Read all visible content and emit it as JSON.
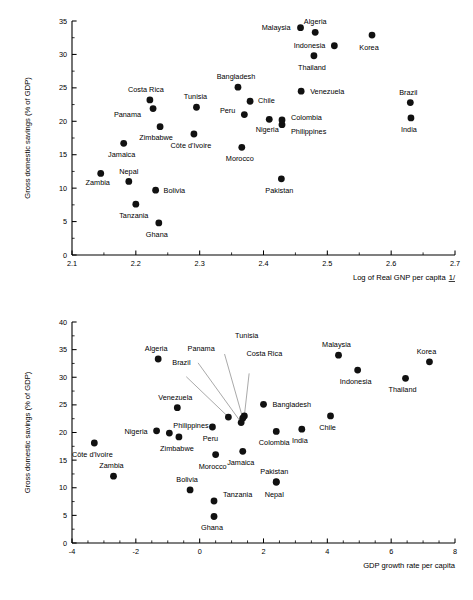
{
  "figure": {
    "background_color": "#ffffff",
    "marker_color": "#111111",
    "axis_color": "#000000",
    "leader_line_color": "#6e6e6e"
  },
  "chart_data": [
    {
      "id": "savings-vs-log-gnp",
      "type": "scatter",
      "title": "",
      "xlabel": "Log of Real GNP per capita 1/",
      "xlabel_text": "Log of Real GNP per capita",
      "xlabel_footnote": "1/",
      "ylabel": "Gross domestic savings (% of GDP)",
      "xlim": [
        2.1,
        2.7
      ],
      "ylim": [
        0,
        35
      ],
      "xticks": [
        2.1,
        2.2,
        2.3,
        2.4,
        2.5,
        2.6,
        2.7
      ],
      "xtick_labels": [
        "2.1",
        "2.2",
        "2.3",
        "2.4",
        "2.5",
        "2.6",
        "2.7"
      ],
      "yticks": [
        0,
        5,
        10,
        15,
        20,
        25,
        30,
        35
      ],
      "ytick_labels": [
        "0",
        "5",
        "10",
        "15",
        "20",
        "25",
        "30",
        "35"
      ],
      "minor_x_step": 0.05,
      "minor_y_step": 2.5,
      "grid": false,
      "legend": "none",
      "points": [
        {
          "name": "Zambia",
          "x": 2.145,
          "y": 12.2,
          "label_dx": -3,
          "label_dy": 12,
          "anchor": "middle"
        },
        {
          "name": "Jamaica",
          "x": 2.181,
          "y": 16.7,
          "label_dx": -2,
          "label_dy": 14,
          "anchor": "middle"
        },
        {
          "name": "Nepal",
          "x": 2.189,
          "y": 11.0,
          "label_dx": 0,
          "label_dy": -7,
          "anchor": "middle"
        },
        {
          "name": "Tanzania",
          "x": 2.2,
          "y": 7.6,
          "label_dx": -2,
          "label_dy": 14,
          "anchor": "middle"
        },
        {
          "name": "Costa Rica",
          "x": 2.222,
          "y": 23.2,
          "label_dx": -4,
          "label_dy": -8,
          "anchor": "middle"
        },
        {
          "name": "Panama",
          "x": 2.227,
          "y": 21.9,
          "label_dx": -12,
          "label_dy": 8,
          "anchor": "end"
        },
        {
          "name": "Bolivia",
          "x": 2.231,
          "y": 9.7,
          "label_dx": 8,
          "label_dy": 3,
          "anchor": "start"
        },
        {
          "name": "Zimbabwe",
          "x": 2.238,
          "y": 19.2,
          "label_dx": -4,
          "label_dy": 13,
          "anchor": "middle"
        },
        {
          "name": "Ghana",
          "x": 2.236,
          "y": 4.8,
          "label_dx": -2,
          "label_dy": 14,
          "anchor": "middle"
        },
        {
          "name": "Tunisia",
          "x": 2.295,
          "y": 22.1,
          "label_dx": -1,
          "label_dy": -8,
          "anchor": "middle"
        },
        {
          "name": "Côte d'Ivoire",
          "x": 2.291,
          "y": 18.1,
          "label_dx": -3,
          "label_dy": 14,
          "anchor": "middle"
        },
        {
          "name": "Bangladesh",
          "x": 2.36,
          "y": 25.1,
          "label_dx": -2,
          "label_dy": -8,
          "anchor": "middle"
        },
        {
          "name": "Morocco",
          "x": 2.366,
          "y": 16.1,
          "label_dx": -2,
          "label_dy": 14,
          "anchor": "middle"
        },
        {
          "name": "Peru",
          "x": 2.37,
          "y": 21.0,
          "label_dx": -9,
          "label_dy": -2,
          "anchor": "end"
        },
        {
          "name": "Chile",
          "x": 2.379,
          "y": 23.0,
          "label_dx": 8,
          "label_dy": 2,
          "anchor": "start"
        },
        {
          "name": "Nigeria",
          "x": 2.409,
          "y": 20.3,
          "label_dx": -2,
          "label_dy": 13,
          "anchor": "middle"
        },
        {
          "name": "Philippines",
          "x": 2.429,
          "y": 19.5,
          "label_dx": 9,
          "label_dy": 9,
          "anchor": "start"
        },
        {
          "name": "Colombia",
          "x": 2.429,
          "y": 20.2,
          "label_dx": 9,
          "label_dy": 0,
          "anchor": "start"
        },
        {
          "name": "Pakistan",
          "x": 2.428,
          "y": 11.4,
          "label_dx": -2,
          "label_dy": 14,
          "anchor": "middle"
        },
        {
          "name": "Malaysia",
          "x": 2.458,
          "y": 34.0,
          "label_dx": -10,
          "label_dy": 2,
          "anchor": "end"
        },
        {
          "name": "Venezuela",
          "x": 2.459,
          "y": 24.5,
          "label_dx": 9,
          "label_dy": 3,
          "anchor": "start"
        },
        {
          "name": "Algeria",
          "x": 2.481,
          "y": 33.3,
          "label_dx": 0,
          "label_dy": -8,
          "anchor": "middle"
        },
        {
          "name": "Thailand",
          "x": 2.479,
          "y": 29.8,
          "label_dx": -2,
          "label_dy": 14,
          "anchor": "middle"
        },
        {
          "name": "Indonesia",
          "x": 2.511,
          "y": 31.3,
          "label_dx": -9,
          "label_dy": 2,
          "anchor": "end"
        },
        {
          "name": "Korea",
          "x": 2.57,
          "y": 32.9,
          "label_dx": -3,
          "label_dy": 15,
          "anchor": "middle"
        },
        {
          "name": "Brazil",
          "x": 2.63,
          "y": 22.8,
          "label_dx": -2,
          "label_dy": -8,
          "anchor": "middle"
        },
        {
          "name": "India",
          "x": 2.631,
          "y": 20.5,
          "label_dx": -2,
          "label_dy": 14,
          "anchor": "middle"
        }
      ],
      "leaders": []
    },
    {
      "id": "savings-vs-gdp-growth",
      "type": "scatter",
      "title": "",
      "xlabel": "GDP growth rate per capita",
      "xlabel_text": "GDP growth rate per capita",
      "xlabel_footnote": "",
      "ylabel": "Gross domestic savings (% of GDP)",
      "xlim": [
        -4,
        8
      ],
      "ylim": [
        0,
        40
      ],
      "xticks": [
        -4,
        -2,
        0,
        2,
        4,
        6,
        8
      ],
      "xtick_labels": [
        "-4",
        "-2",
        "0",
        "2",
        "4",
        "6",
        "8"
      ],
      "yticks": [
        0,
        5,
        10,
        15,
        20,
        25,
        30,
        35,
        40
      ],
      "ytick_labels": [
        "0",
        "5",
        "10",
        "15",
        "20",
        "25",
        "30",
        "35",
        "40"
      ],
      "minor_x_step": 0.5,
      "minor_y_step": 2.5,
      "grid": false,
      "legend": "none",
      "points": [
        {
          "name": "Côte d'Ivoire",
          "x": -3.3,
          "y": 18.1,
          "label_dx": -2,
          "label_dy": 14,
          "anchor": "middle"
        },
        {
          "name": "Zambia",
          "x": -2.7,
          "y": 12.1,
          "label_dx": -2,
          "label_dy": -8,
          "anchor": "middle"
        },
        {
          "name": "Algeria",
          "x": -1.3,
          "y": 33.3,
          "label_dx": -2,
          "label_dy": -8,
          "anchor": "middle"
        },
        {
          "name": "Nigeria",
          "x": -1.35,
          "y": 20.3,
          "label_dx": -9,
          "label_dy": 3,
          "anchor": "end"
        },
        {
          "name": "Venezuela",
          "x": -0.7,
          "y": 24.5,
          "label_dx": -2,
          "label_dy": -8,
          "anchor": "middle"
        },
        {
          "name": "Zimbabwe",
          "x": -0.65,
          "y": 19.2,
          "label_dx": -2,
          "label_dy": 14,
          "anchor": "middle"
        },
        {
          "name": "Philippines",
          "x": -0.95,
          "y": 19.9,
          "label_dx": 4,
          "label_dy": -5,
          "anchor": "start"
        },
        {
          "name": "Bolivia",
          "x": -0.3,
          "y": 9.6,
          "label_dx": -3,
          "label_dy": -8,
          "anchor": "middle"
        },
        {
          "name": "Peru",
          "x": 0.4,
          "y": 21.0,
          "label_dx": -2,
          "label_dy": 14,
          "anchor": "middle"
        },
        {
          "name": "Tanzania",
          "x": 0.45,
          "y": 7.6,
          "label_dx": 9,
          "label_dy": -4,
          "anchor": "start"
        },
        {
          "name": "Morocco",
          "x": 0.5,
          "y": 16.0,
          "label_dx": -3,
          "label_dy": 14,
          "anchor": "middle"
        },
        {
          "name": "Ghana",
          "x": 0.45,
          "y": 4.8,
          "label_dx": -2,
          "label_dy": 14,
          "anchor": "middle"
        },
        {
          "name": "Brazil",
          "x": 0.9,
          "y": 22.8,
          "label_dx": -47,
          "label_dy": -52,
          "anchor": "middle"
        },
        {
          "name": "Panama",
          "x": 1.3,
          "y": 21.8,
          "label_dx": -40,
          "label_dy": -72,
          "anchor": "middle"
        },
        {
          "name": "Costa Rica",
          "x": 1.4,
          "y": 23.0,
          "label_dx": 20,
          "label_dy": -60,
          "anchor": "middle"
        },
        {
          "name": "Tunisia",
          "x": 1.35,
          "y": 22.6,
          "label_dx": 4,
          "label_dy": -80,
          "anchor": "middle"
        },
        {
          "name": "Jamaica",
          "x": 1.35,
          "y": 16.6,
          "label_dx": -2,
          "label_dy": 14,
          "anchor": "middle"
        },
        {
          "name": "Bangladesh",
          "x": 2.0,
          "y": 25.1,
          "label_dx": 9,
          "label_dy": 3,
          "anchor": "start"
        },
        {
          "name": "Colombia",
          "x": 2.4,
          "y": 20.2,
          "label_dx": -2,
          "label_dy": 14,
          "anchor": "middle"
        },
        {
          "name": "Pakistan",
          "x": 2.4,
          "y": 11.1,
          "label_dx": -2,
          "label_dy": -8,
          "anchor": "middle"
        },
        {
          "name": "Nepal",
          "x": 2.4,
          "y": 11.0,
          "label_dx": -2,
          "label_dy": 15,
          "anchor": "middle"
        },
        {
          "name": "India",
          "x": 3.2,
          "y": 20.6,
          "label_dx": -2,
          "label_dy": 14,
          "anchor": "middle"
        },
        {
          "name": "Chile",
          "x": 4.1,
          "y": 23.0,
          "label_dx": -3,
          "label_dy": 14,
          "anchor": "middle"
        },
        {
          "name": "Malaysia",
          "x": 4.35,
          "y": 34.0,
          "label_dx": -2,
          "label_dy": -8,
          "anchor": "middle"
        },
        {
          "name": "Indonesia",
          "x": 4.95,
          "y": 31.3,
          "label_dx": -2,
          "label_dy": 14,
          "anchor": "middle"
        },
        {
          "name": "Thailand",
          "x": 6.45,
          "y": 29.8,
          "label_dx": -3,
          "label_dy": 14,
          "anchor": "middle"
        },
        {
          "name": "Korea",
          "x": 7.2,
          "y": 32.8,
          "label_dx": -3,
          "label_dy": -8,
          "anchor": "middle"
        }
      ],
      "leaders": [
        {
          "name": "Brazil",
          "from_label": true,
          "x": 0.9,
          "y": 22.8,
          "lx": -0.42,
          "ly": 30.1
        },
        {
          "name": "Panama",
          "from_label": true,
          "x": 1.3,
          "y": 21.8,
          "lx": -0.05,
          "ly": 32.6
        },
        {
          "name": "Costa Rica",
          "from_label": true,
          "x": 1.4,
          "y": 23.0,
          "lx": 1.55,
          "ly": 30.7
        },
        {
          "name": "Tunisia",
          "from_label": true,
          "x": 1.35,
          "y": 22.6,
          "lx": 0.78,
          "ly": 34.2
        }
      ]
    }
  ]
}
